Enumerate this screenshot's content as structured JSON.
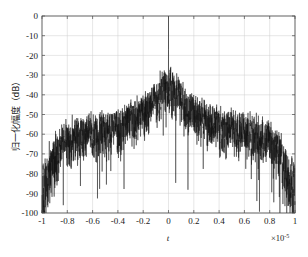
{
  "chart_data": {
    "type": "line",
    "title": "",
    "subtitle": "",
    "xlabel": "t",
    "ylabel": "归一化幅度（dB）",
    "x_exponent_label": "×10",
    "x_exponent_value": "-5",
    "xlim": [
      -1,
      1
    ],
    "ylim": [
      -100,
      0
    ],
    "x_ticks": [
      -1,
      -0.8,
      -0.6,
      -0.4,
      -0.2,
      0,
      0.2,
      0.4,
      0.6,
      0.8,
      1
    ],
    "x_tick_labels": [
      "-1",
      "-0.8",
      "-0.6",
      "-0.4",
      "-0.2",
      "0",
      "0.2",
      "0.4",
      "0.6",
      "0.8",
      "1"
    ],
    "y_ticks": [
      0,
      -10,
      -20,
      -30,
      -40,
      -50,
      -60,
      -70,
      -80,
      -90,
      -100
    ],
    "y_tick_labels": [
      "0",
      "-10",
      "-20",
      "-30",
      "-40",
      "-50",
      "-60",
      "-70",
      "-80",
      "-90",
      "-100"
    ],
    "grid": true,
    "legend": null,
    "legend_position": "none",
    "series": [
      {
        "name": "归一化幅度",
        "color": "#111111",
        "description": "Normalized amplitude spectrum in dB; narrow spike to 0 dB at t=0, main lobe peak near -17 dB, mid-range dense band between -35 and -50 dB, edge plateau near -58 dB with nulls to -95 dB",
        "envelope_points": [
          {
            "x": -1.0,
            "y": -60
          },
          {
            "x": -0.95,
            "y": -59
          },
          {
            "x": -0.9,
            "y": -52
          },
          {
            "x": -0.85,
            "y": -47
          },
          {
            "x": -0.8,
            "y": -45
          },
          {
            "x": -0.7,
            "y": -43
          },
          {
            "x": -0.6,
            "y": -41
          },
          {
            "x": -0.5,
            "y": -40
          },
          {
            "x": -0.4,
            "y": -38
          },
          {
            "x": -0.3,
            "y": -35
          },
          {
            "x": -0.2,
            "y": -31
          },
          {
            "x": -0.1,
            "y": -25
          },
          {
            "x": -0.05,
            "y": -20
          },
          {
            "x": 0.0,
            "y": -17
          },
          {
            "x": 0.05,
            "y": -20
          },
          {
            "x": 0.1,
            "y": -25
          },
          {
            "x": 0.2,
            "y": -31
          },
          {
            "x": 0.3,
            "y": -35
          },
          {
            "x": 0.4,
            "y": -38
          },
          {
            "x": 0.5,
            "y": -40
          },
          {
            "x": 0.6,
            "y": -41
          },
          {
            "x": 0.7,
            "y": -43
          },
          {
            "x": 0.8,
            "y": -45
          },
          {
            "x": 0.85,
            "y": -47
          },
          {
            "x": 0.9,
            "y": -52
          },
          {
            "x": 0.95,
            "y": -59
          },
          {
            "x": 1.0,
            "y": -60
          }
        ],
        "peak_spike": {
          "x": 0,
          "y": 0
        },
        "floor_min": -100
      }
    ]
  }
}
